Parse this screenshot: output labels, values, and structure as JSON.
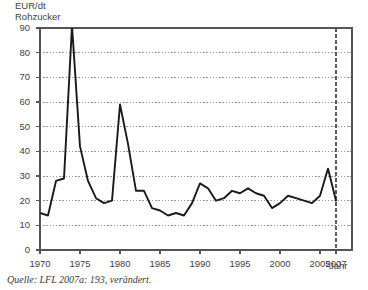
{
  "figure": {
    "y_axis_title": "EUR/dt\nRohzucker",
    "x_axis_title": "Jahr",
    "source_note": "Quelle: LFL 2007a: 193, verändert."
  },
  "chart_data": {
    "type": "line",
    "title": "",
    "subtitle": "",
    "xlabel": "Jahr",
    "ylabel": "EUR/dt Rohzucker",
    "xlim": [
      1970,
      2009
    ],
    "ylim": [
      0,
      90
    ],
    "grid": true,
    "grid_axis": "y",
    "legend": "none",
    "line_color": "#1a1a1a",
    "grid_color": "#9a9a9a",
    "axis_color": "#555555",
    "ytick_labels": [
      "0",
      "10",
      "20",
      "30",
      "40",
      "50",
      "60",
      "70",
      "80",
      "90"
    ],
    "ytick_values": [
      0,
      10,
      20,
      30,
      40,
      50,
      60,
      70,
      80,
      90
    ],
    "xtick_labels": [
      "1970",
      "1975",
      "1980",
      "1985",
      "1990",
      "1995",
      "2000",
      "2005",
      "2007"
    ],
    "xtick_values": [
      1970,
      1975,
      1980,
      1985,
      1990,
      1995,
      2000,
      2005,
      2007
    ],
    "x": [
      1970,
      1971,
      1972,
      1973,
      1974,
      1975,
      1976,
      1977,
      1978,
      1979,
      1980,
      1981,
      1982,
      1983,
      1984,
      1985,
      1986,
      1987,
      1988,
      1989,
      1990,
      1991,
      1992,
      1993,
      1994,
      1995,
      1996,
      1997,
      1998,
      1999,
      2000,
      2001,
      2002,
      2003,
      2004,
      2005,
      2006,
      2007
    ],
    "values": [
      15,
      14,
      28,
      29,
      91,
      42,
      28,
      21,
      19,
      20,
      59,
      43,
      24,
      24,
      17,
      16,
      14,
      15,
      14,
      19,
      27,
      25,
      20,
      21,
      24,
      23,
      25,
      23,
      22,
      17,
      19,
      22,
      21,
      20,
      19,
      22,
      33,
      20
    ],
    "annotations": [
      {
        "type": "vline",
        "x": 2007,
        "style": "dashed",
        "color": "#5a5a5a"
      }
    ]
  }
}
